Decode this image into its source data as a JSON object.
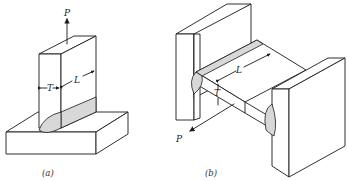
{
  "figure": {
    "panel_a": {
      "caption": "(a)",
      "labels": {
        "force": "P",
        "thickness": "T",
        "length": "L"
      },
      "description": "Vertical plate fillet-welded to a horizontal base plate, loaded upward by force P"
    },
    "panel_b": {
      "caption": "(b)",
      "labels": {
        "force": "P",
        "thickness": "T",
        "length": "L"
      },
      "description": "Horizontal plate welded between two vertical end plates, loaded by force P"
    }
  }
}
